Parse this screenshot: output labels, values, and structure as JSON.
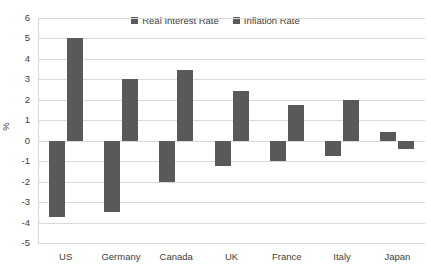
{
  "chart_data": {
    "type": "bar",
    "title": "",
    "subtitle": "",
    "xlabel": "",
    "ylabel": "%",
    "ylim": [
      -5,
      6
    ],
    "ytick_step": 1,
    "yticks": [
      6,
      5,
      4,
      3,
      2,
      1,
      0,
      -1,
      -2,
      -3,
      -4,
      -5
    ],
    "ytick_labels": [
      "6",
      "5",
      "4",
      "3",
      "2",
      "1",
      "0",
      "-1",
      "-2",
      "-3",
      "-4",
      "-5"
    ],
    "categories": [
      "US",
      "Germany",
      "Canada",
      "UK",
      "France",
      "Italy",
      "Japan"
    ],
    "series": [
      {
        "name": "Real Interest Rate",
        "color": "#595959",
        "values": [
          -3.75,
          -3.5,
          -2.0,
          -1.25,
          -1.0,
          -0.75,
          0.45
        ]
      },
      {
        "name": "Inflation Rate",
        "color": "#595959",
        "values": [
          5.0,
          3.0,
          3.45,
          2.45,
          1.75,
          2.0,
          -0.4
        ]
      }
    ],
    "grid": true,
    "grid_axis": "y",
    "legend_position": "top-center",
    "gridline_color": "#d9d9d9",
    "text_color": "#404040",
    "background": "#ffffff"
  }
}
